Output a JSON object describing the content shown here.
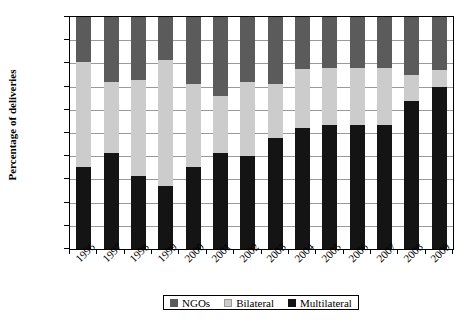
{
  "chart_data": {
    "type": "bar",
    "subtype": "stacked-100-percent",
    "title": "",
    "xlabel": "",
    "ylabel": "Percentage of deliveries",
    "ylim": [
      0,
      100
    ],
    "yticks": [
      "0%",
      "10%",
      "20%",
      "30%",
      "40%",
      "50%",
      "60%",
      "70%",
      "80%",
      "90%",
      "100%"
    ],
    "ytick_values": [
      0,
      10,
      20,
      30,
      40,
      50,
      60,
      70,
      80,
      90,
      100
    ],
    "grid": true,
    "legend_position": "bottom",
    "categories": [
      "1996",
      "1997",
      "1998",
      "1999",
      "2000",
      "2001",
      "2002",
      "2003",
      "2004",
      "2005",
      "2006",
      "2007",
      "2008",
      "2009"
    ],
    "series": [
      {
        "name": "Multilateral",
        "color": "#141414",
        "values": [
          35.5,
          41.5,
          31.5,
          27.0,
          35.5,
          41.5,
          40.0,
          48.0,
          52.0,
          53.5,
          53.5,
          53.5,
          64.0,
          70.0
        ]
      },
      {
        "name": "Bilateral",
        "color": "#cccccc",
        "values": [
          45.0,
          30.5,
          41.5,
          54.5,
          35.5,
          24.5,
          32.0,
          23.0,
          25.5,
          24.5,
          24.5,
          24.5,
          11.0,
          7.0
        ]
      },
      {
        "name": "NGOs",
        "color": "#5b5b5b",
        "values": [
          19.5,
          28.0,
          27.0,
          18.5,
          29.0,
          34.0,
          28.0,
          29.0,
          22.5,
          22.0,
          22.0,
          22.0,
          25.0,
          23.0
        ]
      }
    ],
    "cumulative_tops": {
      "multilateral": [
        35.5,
        41.5,
        31.5,
        27.0,
        35.5,
        41.5,
        40.0,
        48.0,
        52.0,
        53.5,
        53.5,
        53.5,
        64.0,
        70.0
      ],
      "bilateral": [
        80.5,
        72.0,
        73.0,
        81.5,
        71.0,
        66.0,
        72.0,
        71.0,
        77.5,
        78.0,
        78.0,
        78.0,
        75.0,
        77.0
      ],
      "ngos": [
        100,
        100,
        100,
        100,
        100,
        100,
        100,
        100,
        100,
        100,
        100,
        100,
        100,
        100
      ]
    }
  },
  "legend": {
    "items": [
      {
        "label": "NGOs",
        "color": "#5b5b5b"
      },
      {
        "label": "Bilateral",
        "color": "#cccccc"
      },
      {
        "label": "Multilateral",
        "color": "#141414"
      }
    ]
  }
}
